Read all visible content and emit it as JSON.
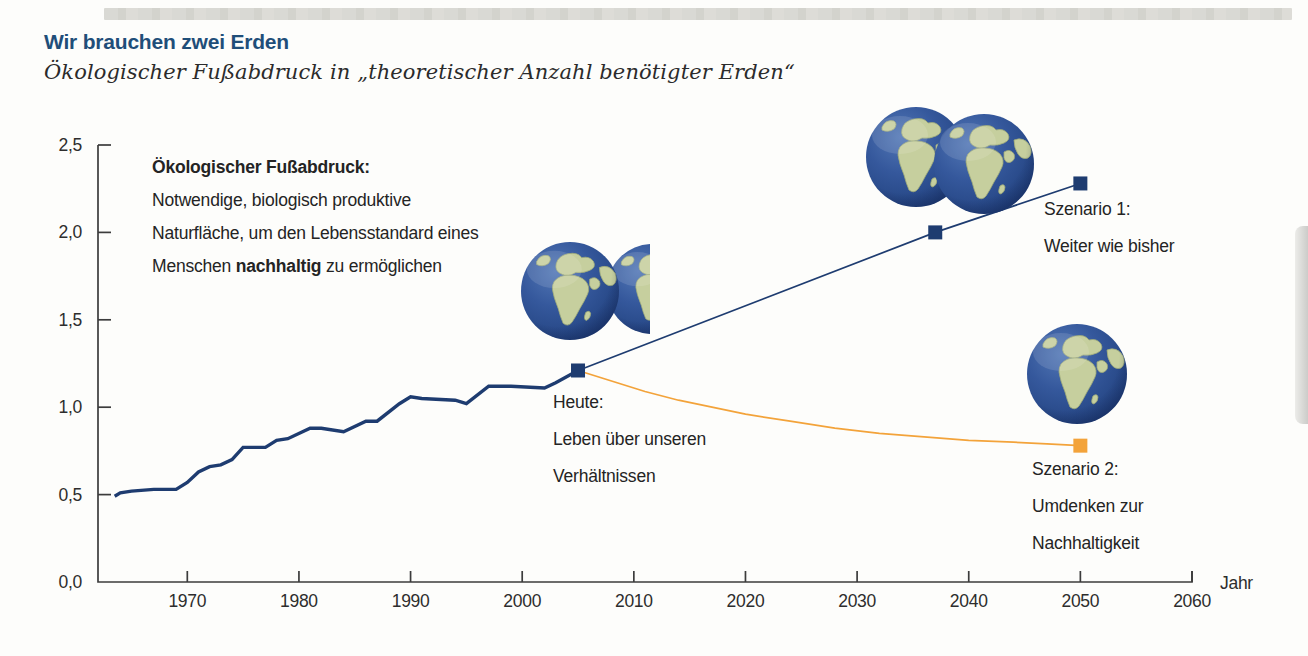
{
  "page": {
    "title": "Wir brauchen zwei Erden",
    "subtitle": "Ökologischer Fußabdruck in „theoretischer Anzahl benötigter Erden“"
  },
  "definition": {
    "heading": "Ökologischer Fußabdruck:",
    "line1": "Notwendige, biologisch produktive",
    "line2": "Naturfläche, um den Lebensstandard eines",
    "line3_pre": "Menschen ",
    "line3_bold": "nachhaltig",
    "line3_post": " zu ermöglichen"
  },
  "annotations": {
    "heute": {
      "line1": "Heute:",
      "line2": "Leben über unseren",
      "line3": "Verhältnissen"
    },
    "szenario1": {
      "line1": "Szenario 1:",
      "line2": "Weiter wie bisher"
    },
    "szenario2": {
      "line1": "Szenario 2:",
      "line2": "Umdenken zur",
      "line3": "Nachhaltigkeit"
    }
  },
  "colors": {
    "navy": "#1e3c70",
    "orange": "#f3a33a",
    "title_blue": "#1f4e79",
    "axis": "#3c3c3c",
    "text": "#2d2d2d",
    "ocean": "#35589c",
    "land": "#c6cf9e"
  },
  "chart_data": {
    "type": "line",
    "title": "Wir brauchen zwei Erden",
    "subtitle": "Ökologischer Fußabdruck in „theoretischer Anzahl benötigter Erden“",
    "xlabel": "Jahr",
    "ylabel": "theoretische Anzahl benötigter Erden",
    "xlim": [
      1962,
      2060
    ],
    "ylim": [
      0,
      2.5
    ],
    "grid": false,
    "legend": "inline-annotations",
    "x_ticks": [
      1970,
      1980,
      1990,
      2000,
      2010,
      2020,
      2030,
      2040,
      2050,
      2060
    ],
    "y_ticks": [
      {
        "v": 0,
        "label": "0,0"
      },
      {
        "v": 0.5,
        "label": "0,5"
      },
      {
        "v": 1,
        "label": "1,0"
      },
      {
        "v": 1.5,
        "label": "1,5"
      },
      {
        "v": 2,
        "label": "2,0"
      },
      {
        "v": 2.5,
        "label": "2,5"
      }
    ],
    "series": [
      {
        "name": "Ökologischer Fußabdruck (historisch)",
        "color": "navy",
        "width": 3.4,
        "points": [
          [
            1963.5,
            0.49
          ],
          [
            1964,
            0.51
          ],
          [
            1965,
            0.52
          ],
          [
            1967,
            0.53
          ],
          [
            1969,
            0.53
          ],
          [
            1970,
            0.57
          ],
          [
            1971,
            0.63
          ],
          [
            1972,
            0.66
          ],
          [
            1973,
            0.67
          ],
          [
            1974,
            0.7
          ],
          [
            1975,
            0.77
          ],
          [
            1977,
            0.77
          ],
          [
            1978,
            0.81
          ],
          [
            1979,
            0.82
          ],
          [
            1981,
            0.88
          ],
          [
            1982,
            0.88
          ],
          [
            1984,
            0.86
          ],
          [
            1986,
            0.92
          ],
          [
            1987,
            0.92
          ],
          [
            1989,
            1.02
          ],
          [
            1990,
            1.06
          ],
          [
            1991,
            1.05
          ],
          [
            1994,
            1.04
          ],
          [
            1995,
            1.02
          ],
          [
            1997,
            1.12
          ],
          [
            1999,
            1.12
          ],
          [
            2002,
            1.11
          ],
          [
            2003,
            1.14
          ],
          [
            2005,
            1.21
          ]
        ],
        "markers": []
      },
      {
        "name": "Szenario 1: Weiter wie bisher",
        "color": "navy",
        "width": 1.7,
        "points": [
          [
            2005,
            1.21
          ],
          [
            2037,
            2.0
          ],
          [
            2050,
            2.28
          ]
        ],
        "markers": [
          [
            2005,
            1.21
          ],
          [
            2037,
            2.0
          ],
          [
            2050,
            2.28
          ]
        ]
      },
      {
        "name": "Szenario 2: Umdenken zur Nachhaltigkeit",
        "color": "orange",
        "width": 1.7,
        "points": [
          [
            2005,
            1.21
          ],
          [
            2008,
            1.15
          ],
          [
            2011,
            1.09
          ],
          [
            2014,
            1.04
          ],
          [
            2017,
            1.0
          ],
          [
            2020,
            0.96
          ],
          [
            2024,
            0.92
          ],
          [
            2028,
            0.88
          ],
          [
            2032,
            0.85
          ],
          [
            2036,
            0.83
          ],
          [
            2040,
            0.81
          ],
          [
            2044,
            0.8
          ],
          [
            2047,
            0.79
          ],
          [
            2050,
            0.78
          ]
        ],
        "markers": [
          [
            2050,
            0.78
          ]
        ]
      }
    ],
    "earth_icons": [
      {
        "name": "heute-earths",
        "earth_count": 1.2,
        "globes": [
          {
            "cx": 652,
            "cy": 289,
            "r": 45,
            "clip_right": 650
          },
          {
            "cx": 570,
            "cy": 291,
            "r": 49
          }
        ]
      },
      {
        "name": "szenario1-earths",
        "earth_count": 2.0,
        "globes": [
          {
            "cx": 916,
            "cy": 157,
            "r": 50
          },
          {
            "cx": 984,
            "cy": 164,
            "r": 50
          }
        ]
      },
      {
        "name": "szenario2-earths",
        "earth_count": 1.0,
        "globes": [
          {
            "cx": 1077,
            "cy": 374,
            "r": 50
          }
        ]
      }
    ]
  }
}
